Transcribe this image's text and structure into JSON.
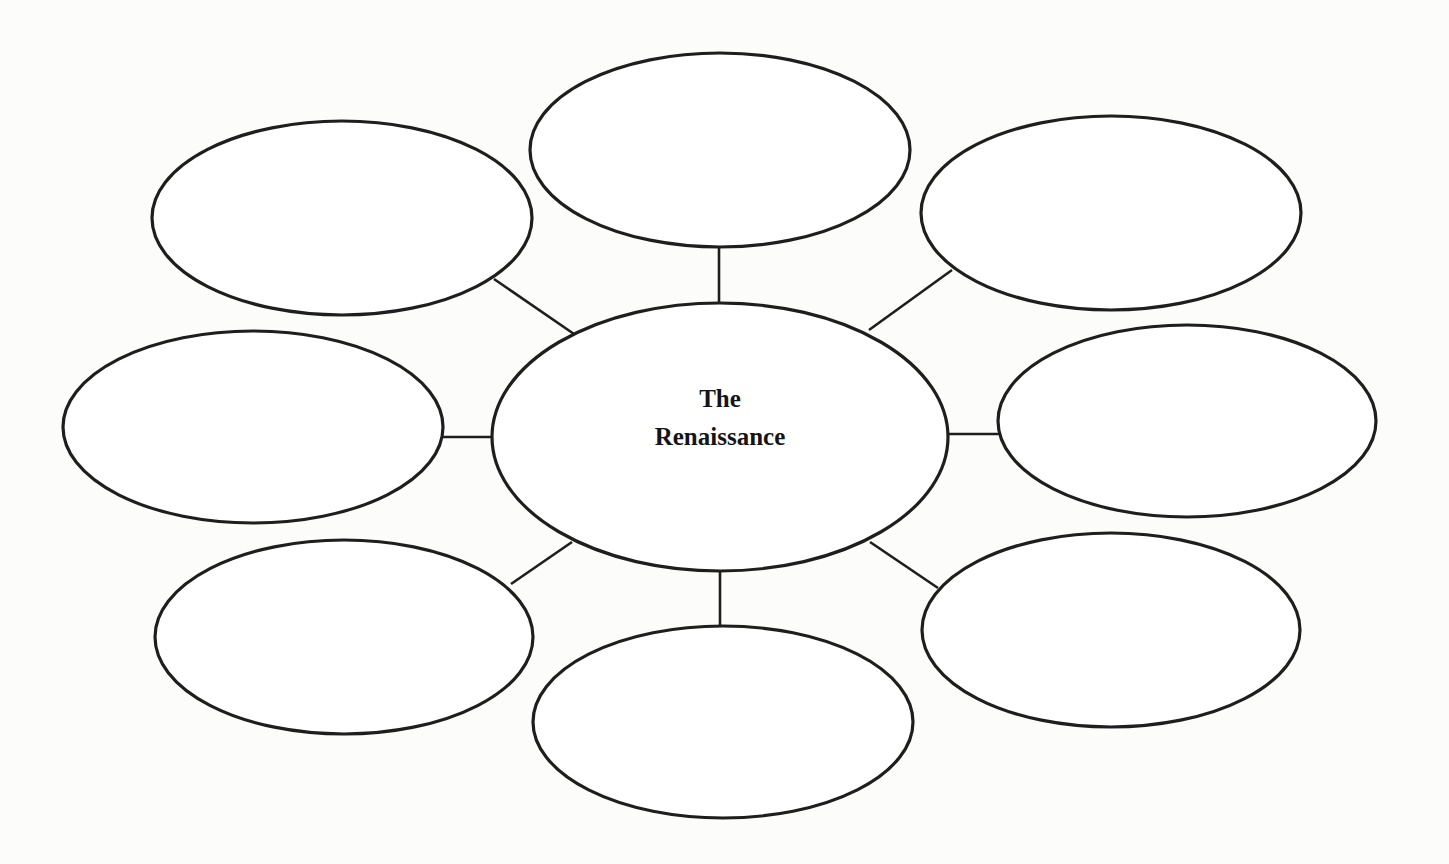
{
  "diagram": {
    "type": "concept-web",
    "center": {
      "title_line1": "The",
      "title_line2": "Renaissance",
      "title": "The Renaissance"
    },
    "satellites": [
      {
        "position": "top",
        "text": ""
      },
      {
        "position": "top-left",
        "text": ""
      },
      {
        "position": "top-right",
        "text": ""
      },
      {
        "position": "left",
        "text": ""
      },
      {
        "position": "right",
        "text": ""
      },
      {
        "position": "bottom-left",
        "text": ""
      },
      {
        "position": "bottom",
        "text": ""
      },
      {
        "position": "bottom-right",
        "text": ""
      }
    ],
    "satellite_count": 8,
    "colors": {
      "stroke": "#1e1e1e",
      "fill": "#ffffff",
      "background": "#fcfcfb",
      "text": "#151515"
    }
  }
}
